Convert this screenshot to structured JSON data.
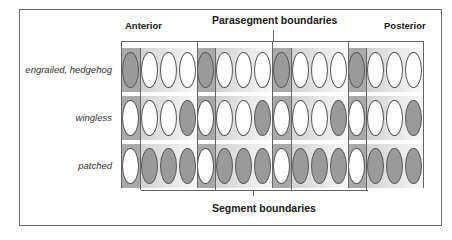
{
  "labels": {
    "anterior": "Anterior",
    "posterior": "Posterior",
    "parasegment": "Parasegment boundaries",
    "segment": "Segment boundaries"
  },
  "rows": [
    {
      "name": "engrailed, hedgehog",
      "filled": [
        1,
        0,
        0,
        0,
        1,
        0,
        0,
        0,
        1,
        0,
        0,
        0,
        1,
        0,
        0,
        0
      ]
    },
    {
      "name": "wingless",
      "filled": [
        0,
        0,
        0,
        1,
        0,
        0,
        0,
        1,
        0,
        0,
        0,
        1,
        0,
        0,
        0,
        1
      ]
    },
    {
      "name": "patched",
      "filled": [
        0,
        1,
        1,
        1,
        0,
        1,
        1,
        1,
        0,
        1,
        1,
        1,
        0,
        1,
        1,
        1
      ]
    }
  ],
  "colors": {
    "filled": "#9a9a9a",
    "empty": "#ffffff",
    "dark_column": "#a9a9a9"
  }
}
